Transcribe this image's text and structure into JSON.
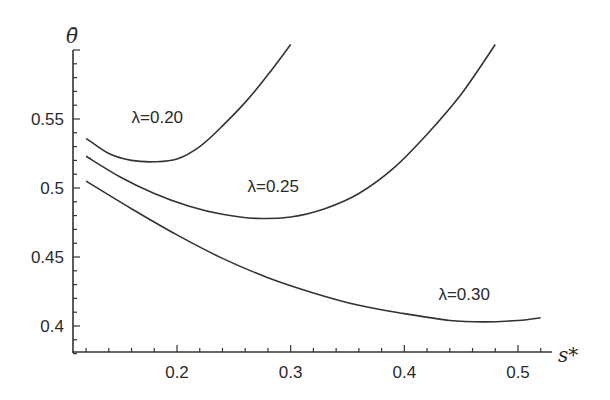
{
  "chart_data": {
    "type": "line",
    "title": "",
    "xlabel": "s*",
    "ylabel": "θ̄",
    "xlim": [
      0.11,
      0.53
    ],
    "ylim": [
      0.38,
      0.6
    ],
    "x_ticks": [
      "0.2",
      "0.3",
      "0.4",
      "0.5"
    ],
    "y_ticks": [
      "0.4",
      "0.45",
      "0.5",
      "0.55"
    ],
    "grid": false,
    "legend": "inline labels",
    "series": [
      {
        "name": "λ=0.20",
        "label": "λ=0.20",
        "x": [
          0.12,
          0.14,
          0.16,
          0.18,
          0.2,
          0.22,
          0.24,
          0.26,
          0.28,
          0.3
        ],
        "y": [
          0.536,
          0.525,
          0.52,
          0.519,
          0.521,
          0.53,
          0.545,
          0.562,
          0.582,
          0.604
        ]
      },
      {
        "name": "λ=0.25",
        "label": "λ=0.25",
        "x": [
          0.12,
          0.15,
          0.18,
          0.21,
          0.24,
          0.27,
          0.3,
          0.33,
          0.36,
          0.39,
          0.42,
          0.45,
          0.48
        ],
        "y": [
          0.523,
          0.508,
          0.496,
          0.487,
          0.481,
          0.478,
          0.479,
          0.485,
          0.496,
          0.514,
          0.539,
          0.568,
          0.604
        ]
      },
      {
        "name": "λ=0.30",
        "label": "λ=0.30",
        "x": [
          0.12,
          0.16,
          0.2,
          0.24,
          0.28,
          0.32,
          0.36,
          0.4,
          0.44,
          0.47,
          0.5,
          0.52
        ],
        "y": [
          0.505,
          0.485,
          0.466,
          0.449,
          0.435,
          0.424,
          0.415,
          0.409,
          0.404,
          0.403,
          0.404,
          0.406
        ]
      }
    ],
    "label_positions": [
      {
        "text": "λ=0.20",
        "x": 0.16,
        "y": 0.547
      },
      {
        "text": "λ=0.25",
        "x": 0.262,
        "y": 0.497
      },
      {
        "text": "λ=0.30",
        "x": 0.43,
        "y": 0.419
      }
    ]
  }
}
